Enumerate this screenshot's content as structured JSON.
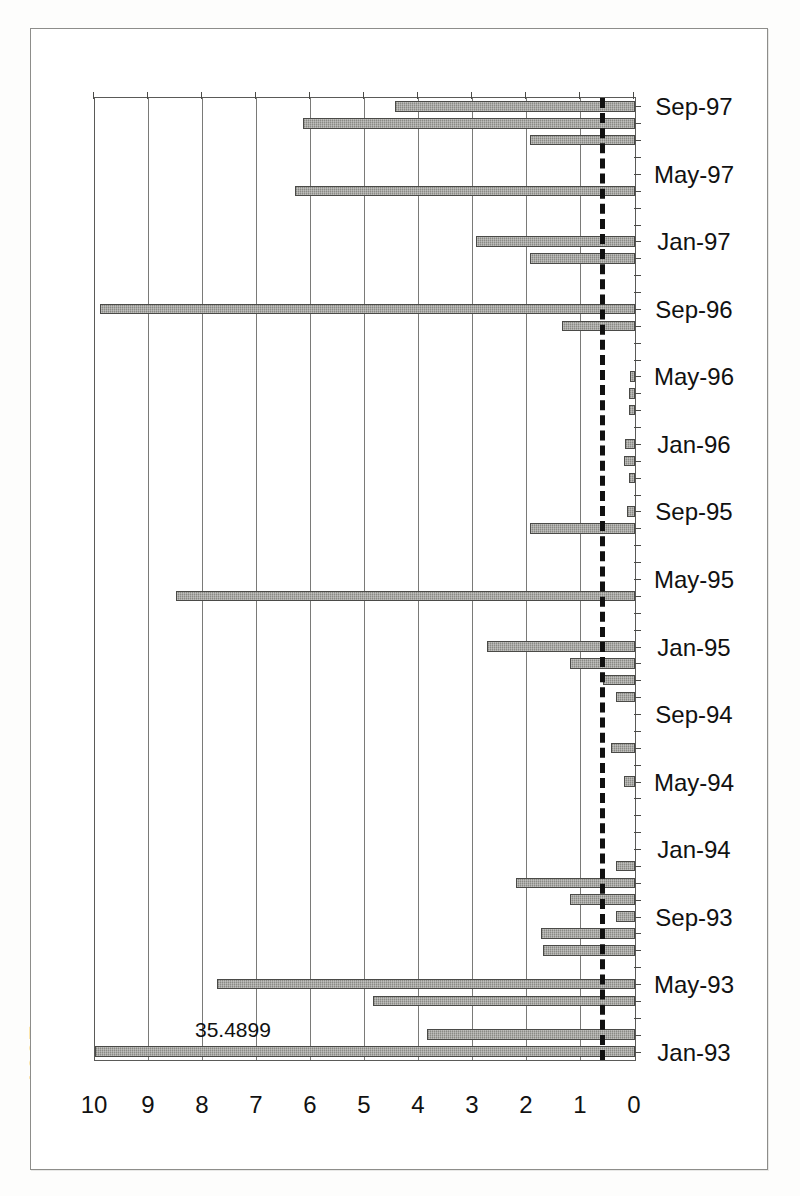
{
  "figure": {
    "caption_fragment": "1997:"
  },
  "chart_data": {
    "type": "bar",
    "orientation": "horizontal-rotated",
    "title": "",
    "subtitle": "",
    "xlabel": "",
    "ylabel": "",
    "ylim": [
      0,
      10
    ],
    "ytick_labels": [
      "0",
      "1",
      "2",
      "3",
      "4",
      "5",
      "6",
      "7",
      "8",
      "9",
      "10"
    ],
    "ytick_values": [
      0,
      1,
      2,
      3,
      4,
      5,
      6,
      7,
      8,
      9,
      10
    ],
    "grid": true,
    "legend": "none",
    "bar_color": "#8a8a85",
    "bar_edge_color": "#4a4a47",
    "threshold_line": {
      "value": 0.55,
      "style": "dashed",
      "color": "#111111",
      "label": ""
    },
    "annotations": [
      {
        "text": "35.4899",
        "category": "Jan-93",
        "note": "value exceeds axis maximum; bar is clipped at 10"
      }
    ],
    "xtick_labels": [
      "Jan-93",
      "May-93",
      "Sep-93",
      "Jan-94",
      "May-94",
      "Sep-94",
      "Jan-95",
      "May-95",
      "Sep-95",
      "Jan-96",
      "May-96",
      "Sep-96",
      "Jan-97",
      "May-97",
      "Sep-97"
    ],
    "categories": [
      "Jan-93",
      "Feb-93",
      "Mar-93",
      "Apr-93",
      "May-93",
      "Jun-93",
      "Jul-93",
      "Aug-93",
      "Sep-93",
      "Oct-93",
      "Nov-93",
      "Dec-93",
      "Jan-94",
      "Feb-94",
      "Mar-94",
      "Apr-94",
      "May-94",
      "Jun-94",
      "Jul-94",
      "Aug-94",
      "Sep-94",
      "Oct-94",
      "Nov-94",
      "Dec-94",
      "Jan-95",
      "Feb-95",
      "Mar-95",
      "Apr-95",
      "May-95",
      "Jun-95",
      "Jul-95",
      "Aug-95",
      "Sep-95",
      "Oct-95",
      "Nov-95",
      "Dec-95",
      "Jan-96",
      "Feb-96",
      "Mar-96",
      "Apr-96",
      "May-96",
      "Jun-96",
      "Jul-96",
      "Aug-96",
      "Sep-96",
      "Oct-96",
      "Nov-96",
      "Dec-96",
      "Jan-97",
      "Feb-97",
      "Mar-97",
      "Apr-97",
      "May-97",
      "Jun-97",
      "Jul-97",
      "Aug-97",
      "Sep-97"
    ],
    "values": [
      10.0,
      3.85,
      0.0,
      4.85,
      7.75,
      0.0,
      1.7,
      1.75,
      0.35,
      1.2,
      2.2,
      0.35,
      0.0,
      0.0,
      0.0,
      0.0,
      0.2,
      0.0,
      0.45,
      0.0,
      0.0,
      0.35,
      0.6,
      1.2,
      2.75,
      0.0,
      0.0,
      8.5,
      0.0,
      0.0,
      0.0,
      1.95,
      0.15,
      0.0,
      0.12,
      0.2,
      0.18,
      0.0,
      0.12,
      0.12,
      0.1,
      0.0,
      0.0,
      1.35,
      9.9,
      0.0,
      0.0,
      1.95,
      2.95,
      0.0,
      0.0,
      6.3,
      0.0,
      0.0,
      1.95,
      6.15,
      4.45
    ]
  }
}
